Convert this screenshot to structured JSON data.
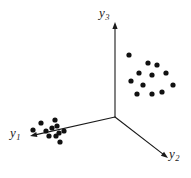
{
  "figure": {
    "background_color": "#ffffff",
    "ink_color": "#1a1a1a",
    "width": 191,
    "height": 178
  },
  "chart_data": {
    "type": "scatter",
    "title": "",
    "subtitle": "",
    "xlabel": "",
    "ylabel": "",
    "grid": false,
    "legend": false,
    "legend_position": "none",
    "projection": "3d-axes",
    "axes": [
      {
        "name": "y3",
        "label": "y₃",
        "label_text": "y",
        "label_subscript": "3",
        "direction": "up",
        "origin": [
          115,
          117
        ],
        "tip": [
          115,
          22
        ],
        "arrow": true,
        "label_position": [
          99,
          6
        ]
      },
      {
        "name": "y1",
        "label": "y₁",
        "label_text": "y",
        "label_subscript": "1",
        "direction": "left-down",
        "origin": [
          115,
          117
        ],
        "tip": [
          30,
          136
        ],
        "arrow": true,
        "label_position": [
          10,
          126
        ]
      },
      {
        "name": "y2",
        "label": "y₂",
        "label_text": "y",
        "label_subscript": "2",
        "direction": "right-down",
        "origin": [
          115,
          117
        ],
        "tip": [
          168,
          158
        ],
        "arrow": true,
        "label_position": [
          169,
          147
        ]
      }
    ],
    "origin": [
      115,
      117
    ],
    "series": [
      {
        "name": "cluster-1",
        "label": "",
        "marker": "filled-circle",
        "marker_radius": 2.6,
        "color": "#111111",
        "count": 11,
        "points": [
          [
            41,
            123
          ],
          [
            33,
            130
          ],
          [
            46,
            131
          ],
          [
            55,
            120
          ],
          [
            52,
            128
          ],
          [
            57,
            126
          ],
          [
            59,
            133
          ],
          [
            49,
            136
          ],
          [
            56,
            136
          ],
          [
            64,
            131
          ],
          [
            60,
            142
          ]
        ]
      },
      {
        "name": "cluster-2",
        "label": "",
        "marker": "filled-circle",
        "marker_radius": 2.6,
        "color": "#111111",
        "count": 12,
        "points": [
          [
            129,
            55
          ],
          [
            148,
            63
          ],
          [
            157,
            65
          ],
          [
            139,
            73
          ],
          [
            152,
            75
          ],
          [
            131,
            81
          ],
          [
            143,
            85
          ],
          [
            166,
            73
          ],
          [
            173,
            85
          ],
          [
            137,
            94
          ],
          [
            152,
            94
          ],
          [
            162,
            92
          ]
        ]
      }
    ]
  }
}
